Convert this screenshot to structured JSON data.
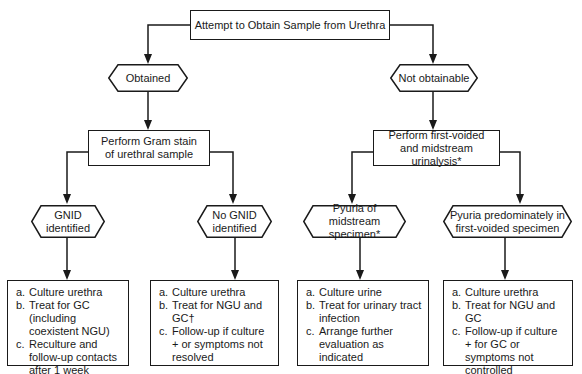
{
  "root": {
    "label": "Attempt to Obtain Sample from Urethra"
  },
  "left": {
    "decision": "Obtained",
    "step": "Perform Gram stain of urethral sample",
    "branches": [
      {
        "decision": "GNID identified",
        "actions": [
          {
            "key": "a.",
            "text": "Culture urethra"
          },
          {
            "key": "b.",
            "text": "Treat for GC (including coexistent NGU)"
          },
          {
            "key": "c.",
            "text": "Reculture and follow-up contacts after 1 week"
          }
        ]
      },
      {
        "decision": "No GNID identified",
        "actions": [
          {
            "key": "a.",
            "text": "Culture urethra"
          },
          {
            "key": "b.",
            "text": "Treat for NGU and GC†"
          },
          {
            "key": "c.",
            "text": "Follow-up if culture + or symptoms not resolved"
          }
        ]
      }
    ]
  },
  "right": {
    "decision": "Not obtainable",
    "step": "Perform first-voided and midstream urinalysis*",
    "branches": [
      {
        "decision": "Pyuria of midstream specimen*",
        "actions": [
          {
            "key": "a.",
            "text": "Culture urine"
          },
          {
            "key": "b.",
            "text": "Treat for urinary tract infection"
          },
          {
            "key": "c.",
            "text": "Arrange further evaluation as indicated"
          }
        ]
      },
      {
        "decision": "Pyuria predominately in first-voided specimen",
        "actions": [
          {
            "key": "a.",
            "text": "Culture urethra"
          },
          {
            "key": "b.",
            "text": "Treat for NGU and GC"
          },
          {
            "key": "c.",
            "text": "Follow-up if culture + for GC or symptoms not controlled"
          }
        ]
      }
    ]
  },
  "colors": {
    "stroke": "#1a1a1a",
    "background": "#ffffff"
  }
}
